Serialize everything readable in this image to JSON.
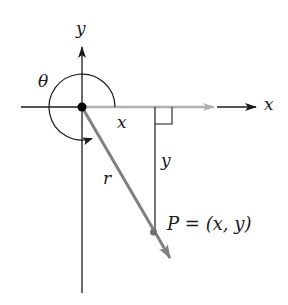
{
  "diagram": {
    "type": "coordinate-angle-diagram",
    "labels": {
      "y_axis": "y",
      "x_axis": "x",
      "theta": "θ",
      "x_leg": "x",
      "y_leg": "y",
      "radius": "r",
      "point_name": "P",
      "point_equals": "=",
      "point_coords": "(x, y)"
    },
    "colors": {
      "axis": "#1a1a1a",
      "vector": "#808080",
      "positive_x_ray": "#b0b0b0",
      "origin_dot": "#000000"
    },
    "geometry": {
      "origin": [
        82,
        107
      ],
      "point_P": [
        153,
        232
      ],
      "vector_tip": [
        170,
        258
      ],
      "right_angle_at": [
        155,
        107
      ],
      "angle_arc": "reflex angle θ measured counterclockwise from positive x-axis into quadrant IV"
    }
  }
}
